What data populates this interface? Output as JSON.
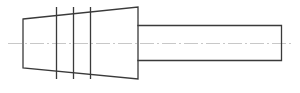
{
  "diagram": {
    "type": "technical-line-drawing",
    "colors": {
      "background": "#ffffff",
      "outline": "#3a3a3a",
      "centerline": "#c8c8c8"
    },
    "taper": {
      "left_x": 23,
      "left_top_y": 19,
      "left_bottom_y": 68,
      "right_x": 138,
      "right_top_y": 7,
      "right_bottom_y": 79
    },
    "section_lines": [
      {
        "x": 56,
        "y1": 7,
        "y2": 79
      },
      {
        "x": 73,
        "y1": 7,
        "y2": 79
      },
      {
        "x": 90,
        "y1": 7,
        "y2": 79
      }
    ],
    "shaft": {
      "x1": 138,
      "x2": 281,
      "top_y": 25,
      "bottom_y": 60
    },
    "centerline": {
      "x1": 8,
      "x2": 291,
      "y": 43
    }
  }
}
